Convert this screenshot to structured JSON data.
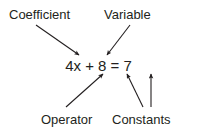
{
  "diagram": {
    "background_color": "#ffffff",
    "ink_color": "#231f20",
    "equation": {
      "text": "4x + 8 = 7",
      "parts": {
        "coefficient": "4",
        "variable": "x",
        "operator": "+",
        "constant_left": "8",
        "constant_right": "7"
      }
    },
    "labels": {
      "coefficient": "Coefficient",
      "variable": "Variable",
      "operator": "Operator",
      "constants": "Constants"
    },
    "arrows": [
      {
        "name": "coefficient-arrow",
        "from_label": "Coefficient",
        "to_part": "4",
        "direction": "down-right"
      },
      {
        "name": "variable-arrow",
        "from_label": "Variable",
        "to_part": "x",
        "direction": "down-left"
      },
      {
        "name": "operator-arrow",
        "from_label": "Operator",
        "to_part": "+",
        "direction": "up-right"
      },
      {
        "name": "constant-left-arrow",
        "from_label": "Constants",
        "to_part": "8",
        "direction": "up-left"
      },
      {
        "name": "constant-right-arrow",
        "from_label": "Constants",
        "to_part": "7",
        "direction": "up"
      }
    ]
  }
}
